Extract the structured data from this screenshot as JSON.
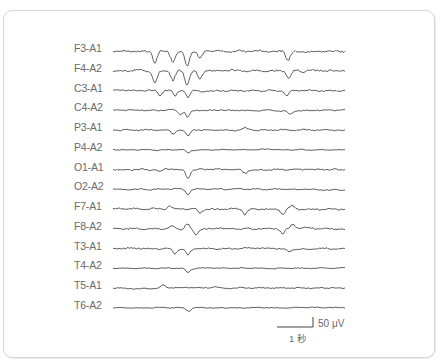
{
  "figure": {
    "type": "EEG recording",
    "channels": [
      {
        "label": "F3-A1",
        "amp": 1.0,
        "events": [
          [
            155,
            -12
          ],
          [
            173,
            -10
          ],
          [
            187,
            -14
          ],
          [
            200,
            -8
          ],
          [
            288,
            -9
          ]
        ]
      },
      {
        "label": "F4-A2",
        "amp": 1.0,
        "events": [
          [
            155,
            -12
          ],
          [
            173,
            -10
          ],
          [
            187,
            -14
          ],
          [
            200,
            -8
          ],
          [
            289,
            -8
          ]
        ]
      },
      {
        "label": "C3-A1",
        "amp": 0.8,
        "events": [
          [
            160,
            -5
          ],
          [
            175,
            -6
          ],
          [
            188,
            -7
          ],
          [
            287,
            -5
          ]
        ]
      },
      {
        "label": "C4-A2",
        "amp": 0.7,
        "events": [
          [
            180,
            -4
          ],
          [
            188,
            -7
          ],
          [
            290,
            -4
          ]
        ]
      },
      {
        "label": "P3-A1",
        "amp": 0.7,
        "events": [
          [
            173,
            -4
          ],
          [
            188,
            -6
          ],
          [
            245,
            2
          ]
        ]
      },
      {
        "label": "P4-A2",
        "amp": 0.5,
        "events": [
          [
            188,
            -3
          ]
        ]
      },
      {
        "label": "O1-A1",
        "amp": 0.8,
        "events": [
          [
            160,
            -3
          ],
          [
            188,
            -8
          ],
          [
            245,
            -3
          ]
        ]
      },
      {
        "label": "O2-A2",
        "amp": 0.6,
        "events": [
          [
            188,
            -5
          ]
        ]
      },
      {
        "label": "F7-A1",
        "amp": 0.9,
        "events": [
          [
            170,
            3
          ],
          [
            200,
            -4
          ],
          [
            245,
            -5
          ],
          [
            283,
            -5
          ],
          [
            292,
            3
          ]
        ]
      },
      {
        "label": "F8-A2",
        "amp": 0.9,
        "events": [
          [
            172,
            3
          ],
          [
            187,
            5
          ],
          [
            196,
            -6
          ],
          [
            283,
            -5
          ],
          [
            293,
            4
          ]
        ]
      },
      {
        "label": "T3-A1",
        "amp": 0.7,
        "events": [
          [
            175,
            -5
          ],
          [
            188,
            -6
          ],
          [
            289,
            -3
          ]
        ]
      },
      {
        "label": "T4-A2",
        "amp": 0.5,
        "events": [
          [
            188,
            -4
          ]
        ]
      },
      {
        "label": "T5-A1",
        "amp": 0.6,
        "events": [
          [
            163,
            3
          ],
          [
            215,
            2
          ]
        ]
      },
      {
        "label": "T6-A2",
        "amp": 0.5,
        "events": [
          [
            189,
            -3
          ]
        ]
      }
    ],
    "scale_bar": {
      "amplitude_label": "50 μV",
      "time_label": "1 秒"
    }
  }
}
